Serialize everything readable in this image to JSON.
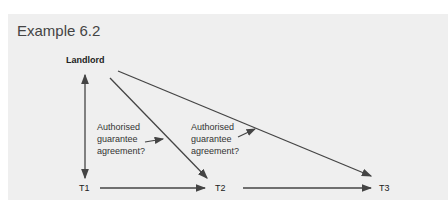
{
  "title": "Example 6.2",
  "nodes": {
    "landlord": "Landlord",
    "t1": "T1",
    "t2": "T2",
    "t3": "T3"
  },
  "notes": [
    {
      "lines": [
        "Authorised",
        "guarantee",
        "agreement?"
      ]
    },
    {
      "lines": [
        "Authorised",
        "guarantee",
        "agreement?"
      ]
    }
  ],
  "colors": {
    "panel": "#efefef",
    "line": "#444444"
  }
}
